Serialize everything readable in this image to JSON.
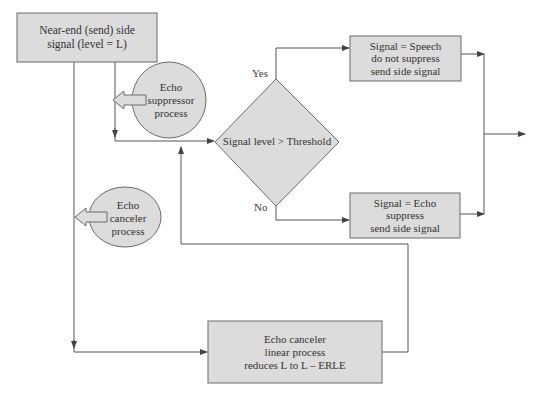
{
  "diagram": {
    "type": "flowchart",
    "colors": {
      "fill": "#dcdcdc",
      "stroke": "#6a6a6a",
      "line": "#555555",
      "text": "#333333",
      "background": "#ffffff"
    },
    "nodes": {
      "near_end": {
        "shape": "rectangle",
        "lines": [
          "Near-end (send) side",
          "signal (level = L)"
        ]
      },
      "echo_suppressor": {
        "shape": "ellipse",
        "lines": [
          "Echo",
          "suppressor",
          "process"
        ]
      },
      "echo_canceler_process": {
        "shape": "ellipse",
        "lines": [
          "Echo",
          "canceler",
          "process"
        ]
      },
      "decision": {
        "shape": "diamond",
        "lines": [
          "Signal level > Threshold"
        ]
      },
      "speech": {
        "shape": "rectangle",
        "lines": [
          "Signal = Speech",
          "do not suppress",
          "send side signal"
        ]
      },
      "echo": {
        "shape": "rectangle",
        "lines": [
          "Signal = Echo",
          "suppress",
          "send side signal"
        ]
      },
      "linear": {
        "shape": "rectangle",
        "lines": [
          "Echo canceler",
          "linear process",
          "reduces L to L – ERLE"
        ]
      }
    },
    "edge_labels": {
      "yes": "Yes",
      "no": "No"
    },
    "edges": [
      {
        "from": "near_end",
        "to": "decision",
        "via": "echo_suppressor"
      },
      {
        "from": "near_end",
        "to": "linear",
        "via": "echo_canceler_process"
      },
      {
        "from": "linear",
        "to": "decision"
      },
      {
        "from": "decision",
        "to": "speech",
        "label": "Yes"
      },
      {
        "from": "decision",
        "to": "echo",
        "label": "No"
      },
      {
        "from": "speech",
        "to": "output"
      },
      {
        "from": "echo",
        "to": "output"
      }
    ]
  }
}
